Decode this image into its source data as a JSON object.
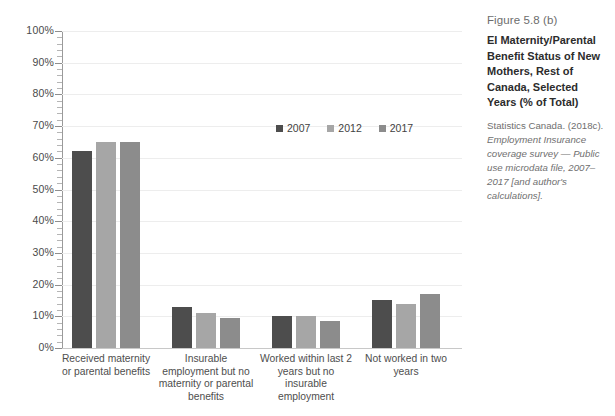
{
  "chart_data": {
    "type": "bar",
    "title": "EI Maternity/Parental Benefit Status of New Mothers, Rest of Canada, Selected Years (% of Total)",
    "xlabel": "",
    "ylabel": "",
    "ylim": [
      0,
      100
    ],
    "ytick_labels": [
      "100%",
      "90%",
      "80%",
      "70%",
      "60%",
      "50%",
      "40%",
      "30%",
      "20%",
      "10%",
      "0%"
    ],
    "ytick_values": [
      100,
      90,
      80,
      70,
      60,
      50,
      40,
      30,
      20,
      10,
      0
    ],
    "grid": true,
    "legend_position": "top-right-inside",
    "categories": [
      "Received maternity or parental benefits",
      "Insurable employment but no maternity or parental benefits",
      "Worked within last 2 years but no insurable employment",
      "Not worked in two years"
    ],
    "series": [
      {
        "name": "2007",
        "color": "#4d4d4d",
        "values": [
          62,
          13,
          10,
          15
        ]
      },
      {
        "name": "2012",
        "color": "#a6a6a6",
        "values": [
          65,
          11,
          10,
          14
        ]
      },
      {
        "name": "2017",
        "color": "#8c8c8c",
        "values": [
          65,
          9.5,
          8.5,
          17
        ]
      }
    ]
  },
  "axis": {
    "ylabels": [
      "100%",
      "90%",
      "80%",
      "70%",
      "60%",
      "50%",
      "40%",
      "30%",
      "20%",
      "10%",
      "0%"
    ]
  },
  "legend": {
    "items": [
      {
        "label": "2007",
        "color": "#4d4d4d"
      },
      {
        "label": "2012",
        "color": "#a6a6a6"
      },
      {
        "label": "2017",
        "color": "#8c8c8c"
      }
    ]
  },
  "group_labels": [
    "Received maternity\nor parental benefits",
    "Insurable\nemployment but no\nmaternity or parental\nbenefits",
    "Worked within last 2\nyears but no\ninsurable\nemployment",
    "Not worked in two\nyears"
  ],
  "side_panel": {
    "figure_number": "Figure 5.8 (b)",
    "title": "EI Maternity/Parental Benefit Status of New Mothers, Rest of Canada, Selected Years (% of Total)",
    "source_prefix": "Statistics Canada. (2018c).",
    "source_italic": "Employment Insurance coverage survey — Public use microdata file, 2007–2017 [and author's calculations]."
  }
}
